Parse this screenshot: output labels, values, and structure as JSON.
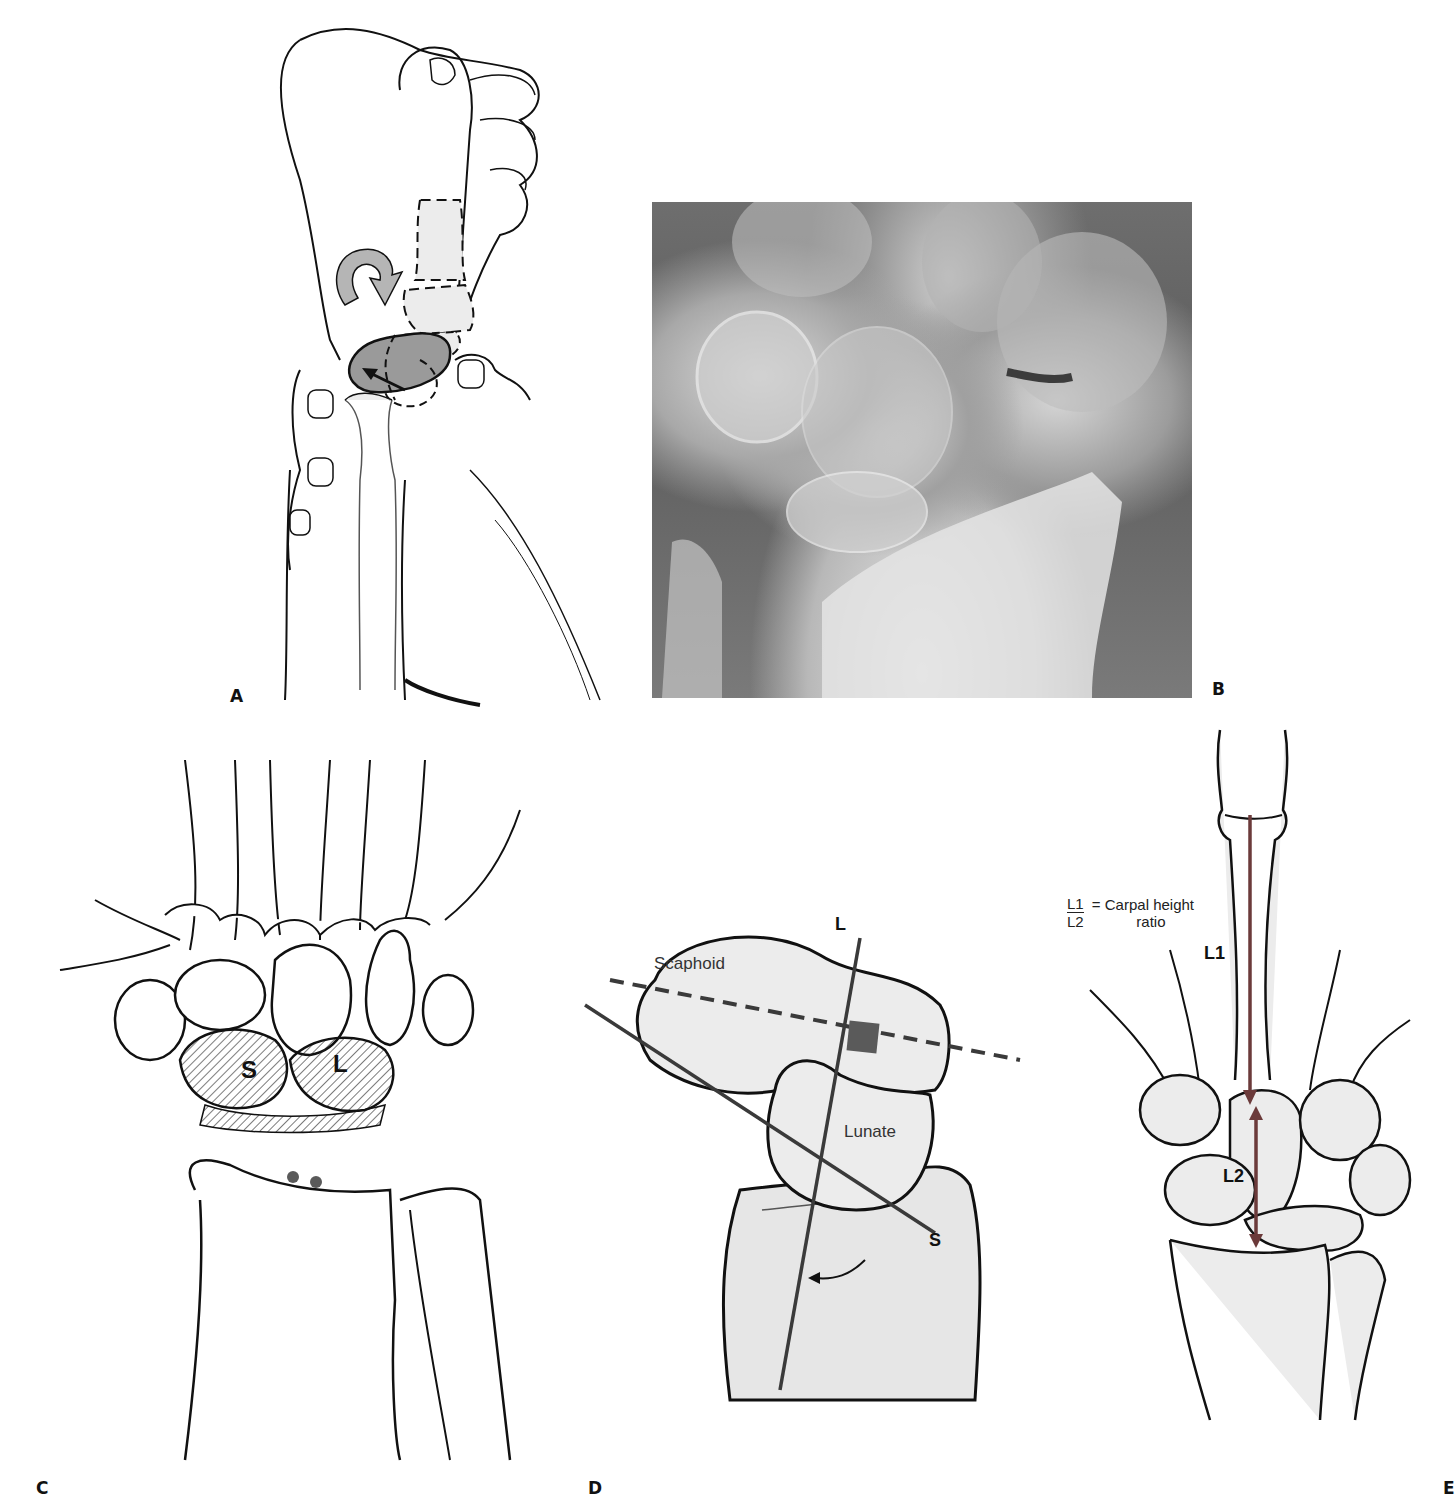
{
  "figure": {
    "panels": [
      {
        "id": "A",
        "label": "A",
        "description": "Hand and wrist line drawing with rotation arrow and shaded carpal bone"
      },
      {
        "id": "B",
        "label": "B",
        "description": "Radiograph of wrist"
      },
      {
        "id": "C",
        "label": "C",
        "description": "Carpal bones illustration",
        "annotations": [
          "S",
          "L"
        ]
      },
      {
        "id": "D",
        "label": "D",
        "description": "Scaphoid and lunate axis diagram",
        "annotations": {
          "scaphoid": "Scaphoid",
          "lunate": "Lunate",
          "axis_l": "L",
          "axis_s": "S"
        }
      },
      {
        "id": "E",
        "label": "E",
        "description": "Carpal height ratio measurement",
        "annotations": {
          "l1": "L1",
          "l2": "L2",
          "formula_num": "L1",
          "formula_den": "L2",
          "formula_text_1": "= Carpal height",
          "formula_text_2": "ratio"
        }
      }
    ]
  },
  "colors": {
    "line": "#111111",
    "bone_fill": "#e6e6e6",
    "shade": "#8a8a8a",
    "axis_red": "#6b3a3a",
    "marker": "#5a5a5a"
  }
}
